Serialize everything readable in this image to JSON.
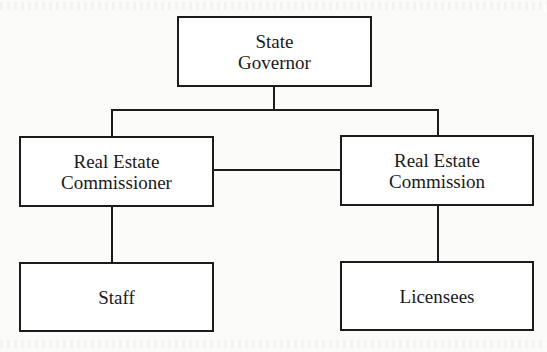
{
  "diagram": {
    "type": "org-chart",
    "line_color": "#1c1c1c",
    "background_color": "#fbfbf9",
    "nodes": {
      "governor": {
        "line1": "State",
        "line2": "Governor"
      },
      "commissioner": {
        "line1": "Real Estate",
        "line2": "Commissioner"
      },
      "commission": {
        "line1": "Real Estate",
        "line2": "Commission"
      },
      "staff": {
        "line1": "Staff"
      },
      "licensees": {
        "line1": "Licensees"
      }
    },
    "edges": [
      {
        "from": "State Governor",
        "to": "Real Estate Commissioner"
      },
      {
        "from": "State Governor",
        "to": "Real Estate Commission"
      },
      {
        "from": "Real Estate Commissioner",
        "to": "Real Estate Commission",
        "style": "lateral"
      },
      {
        "from": "Real Estate Commissioner",
        "to": "Staff"
      },
      {
        "from": "Real Estate Commission",
        "to": "Licensees"
      }
    ]
  }
}
